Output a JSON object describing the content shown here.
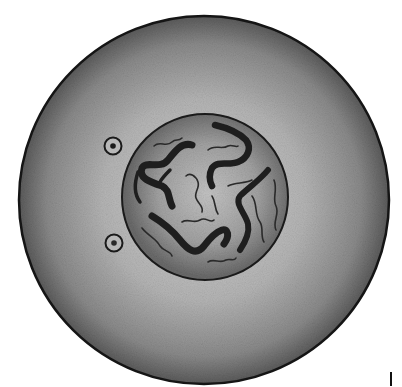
{
  "diagram": {
    "style": "grayscale pencil illustration",
    "background": "#ffffff",
    "cell": {
      "center": [
        204,
        200
      ],
      "radius": 185,
      "outline_color": "#151515",
      "fill_outer": "#5e5e5e",
      "fill_inner": "#c8c8c8"
    },
    "nucleus": {
      "center": [
        205,
        197
      ],
      "radius": 83,
      "outline_color": "#1a1a1a",
      "fill_outer": "#6e6e6e",
      "fill_inner": "#bcbcbc",
      "chromatin_color": "#1e1e1e"
    },
    "centrioles": [
      {
        "center": [
          113,
          146
        ],
        "radius": 8
      },
      {
        "center": [
          114,
          243
        ],
        "radius": 8
      }
    ],
    "mark": {
      "x": 391,
      "y1": 372,
      "y2": 386
    }
  }
}
